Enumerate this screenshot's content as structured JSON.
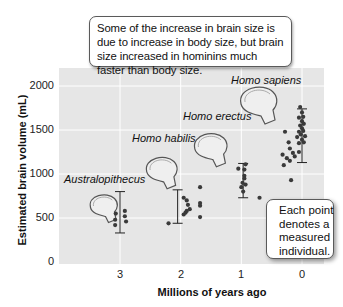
{
  "chart_data": {
    "type": "scatter",
    "title": "",
    "xlabel": "Millions of years ago",
    "ylabel": "Estimated brain volume (mL)",
    "xlim": [
      3.85,
      -0.38
    ],
    "ylim": [
      0,
      2200
    ],
    "x_ticks": [
      "3",
      "2",
      "1",
      "0"
    ],
    "y_ticks": [
      "0",
      "500",
      "1000",
      "1500",
      "2000"
    ],
    "grid": true,
    "series": [
      {
        "name": "Australopithecus",
        "label_pos": [
          3.25,
          1030
        ],
        "range_bar": {
          "x": 3.0,
          "low": 330,
          "high": 800
        },
        "points": [
          [
            3.08,
            480
          ],
          [
            3.08,
            420
          ],
          [
            3.07,
            550
          ],
          [
            2.92,
            520
          ],
          [
            2.9,
            460
          ],
          [
            2.92,
            580
          ]
        ]
      },
      {
        "name": "Homo habilis",
        "label_pos": [
          2.25,
          1500
        ],
        "range_bar": {
          "x": 2.05,
          "low": 440,
          "high": 820
        },
        "points": [
          [
            2.2,
            440
          ],
          [
            1.95,
            730
          ],
          [
            1.9,
            700
          ],
          [
            1.88,
            650
          ],
          [
            1.95,
            540
          ],
          [
            1.85,
            600
          ],
          [
            1.9,
            580
          ],
          [
            1.92,
            560
          ],
          [
            1.68,
            850
          ],
          [
            1.68,
            670
          ],
          [
            1.68,
            640
          ],
          [
            1.68,
            510
          ]
        ]
      },
      {
        "name": "Homo erectus",
        "label_pos": [
          1.18,
          1690
        ],
        "range_bar": {
          "x": 0.97,
          "low": 730,
          "high": 1120
        },
        "points": [
          [
            1.05,
            1060
          ],
          [
            0.93,
            1110
          ],
          [
            0.95,
            1050
          ],
          [
            0.95,
            980
          ],
          [
            0.95,
            950
          ],
          [
            0.98,
            900
          ],
          [
            0.93,
            880
          ],
          [
            1.0,
            850
          ],
          [
            0.97,
            800
          ],
          [
            0.7,
            730
          ]
        ]
      },
      {
        "name": "Homo sapiens",
        "label_pos": [
          0.25,
          2010
        ],
        "range_bar": {
          "x": 0.0,
          "low": 1130,
          "high": 1740
        },
        "points": [
          [
            0.03,
            1760
          ],
          [
            0.0,
            1700
          ],
          [
            -0.02,
            1650
          ],
          [
            0.05,
            1640
          ],
          [
            0.0,
            1600
          ],
          [
            -0.03,
            1570
          ],
          [
            0.03,
            1550
          ],
          [
            0.0,
            1520
          ],
          [
            -0.02,
            1490
          ],
          [
            0.05,
            1480
          ],
          [
            0.02,
            1450
          ],
          [
            -0.05,
            1430
          ],
          [
            0.08,
            1420
          ],
          [
            0.0,
            1390
          ],
          [
            -0.03,
            1360
          ],
          [
            0.05,
            1350
          ],
          [
            0.28,
            1480
          ],
          [
            0.22,
            1360
          ],
          [
            0.2,
            1290
          ],
          [
            0.32,
            1220
          ],
          [
            0.15,
            1240
          ],
          [
            0.25,
            1180
          ],
          [
            0.2,
            1150
          ],
          [
            0.12,
            1200
          ],
          [
            0.3,
            1100
          ],
          [
            0.05,
            1250
          ],
          [
            0.18,
            930
          ]
        ]
      }
    ],
    "annotations": [
      "Some of the increase in brain size is due to increase in body size, but brain size increased in hominins much faster than body size.",
      "Each point denotes a measured individual."
    ]
  },
  "callouts": {
    "top": "Some of the increase in brain size is due to increase in body size, but brain size increased in hominins much faster than body size.",
    "right_lines": [
      "Each point",
      "denotes a",
      "measured",
      "individual."
    ]
  },
  "axes": {
    "ylabel": "Estimated brain volume (mL)",
    "xlabel": "Millions of years ago",
    "y_ticks": [
      "2000",
      "1500",
      "1000",
      "500",
      "0"
    ],
    "x_ticks": [
      "3",
      "2",
      "1",
      "0"
    ]
  },
  "species_labels": {
    "australopithecus": "Australopithecus",
    "habilis": "Homo habilis",
    "erectus": "Homo erectus",
    "sapiens": "Homo sapiens"
  },
  "colors": {
    "plot_bg": "#e6e6e6",
    "grid": "#ffffff",
    "point": "#3a3a3a",
    "skull_fill": "#efefef",
    "skull_stroke": "#555555"
  }
}
